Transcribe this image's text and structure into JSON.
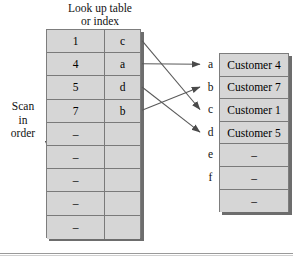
{
  "figure": {
    "title_line1": "Look up table",
    "title_line2": "or index",
    "scan_line1": "Scan",
    "scan_line2": "in",
    "scan_line3": "order"
  },
  "lookup_table": {
    "rows": [
      {
        "key": "1",
        "pointer": "c"
      },
      {
        "key": "4",
        "pointer": "a"
      },
      {
        "key": "5",
        "pointer": "d"
      },
      {
        "key": "7",
        "pointer": "b"
      },
      {
        "key": "–",
        "pointer": ""
      },
      {
        "key": "–",
        "pointer": ""
      },
      {
        "key": "–",
        "pointer": ""
      },
      {
        "key": "–",
        "pointer": ""
      },
      {
        "key": "–",
        "pointer": ""
      }
    ]
  },
  "data_table": {
    "letters": [
      "a",
      "b",
      "c",
      "d",
      "e",
      "f",
      ""
    ],
    "rows": [
      {
        "label": "a",
        "value": "Customer 4"
      },
      {
        "label": "b",
        "value": "Customer 7"
      },
      {
        "label": "c",
        "value": "Customer 1"
      },
      {
        "label": "d",
        "value": "Customer 5"
      },
      {
        "label": "e",
        "value": "–"
      },
      {
        "label": "f",
        "value": "–"
      },
      {
        "label": "",
        "value": "–"
      }
    ]
  },
  "links": [
    {
      "from_row": 0,
      "from_pointer": "c",
      "to_letter": "c"
    },
    {
      "from_row": 1,
      "from_pointer": "a",
      "to_letter": "a"
    },
    {
      "from_row": 2,
      "from_pointer": "d",
      "to_letter": "d"
    },
    {
      "from_row": 3,
      "from_pointer": "b",
      "to_letter": "b"
    }
  ],
  "colors": {
    "cell_fill": "#d6d6d6",
    "cell_border": "#7a7a7a",
    "shadow": "#6d6d6d",
    "arrow": "#555555",
    "text": "#111111"
  }
}
